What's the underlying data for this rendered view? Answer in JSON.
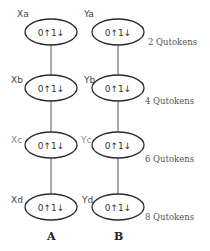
{
  "diagram": {
    "columns": [
      {
        "label": "A",
        "nodes": [
          {
            "name": "Xa",
            "text": "0↑1↓"
          },
          {
            "name": "Xb",
            "text": "0↑1↓"
          },
          {
            "name": "Xc",
            "text": "0↑1↓"
          },
          {
            "name": "Xd",
            "text": "0↑1↓"
          }
        ]
      },
      {
        "label": "B",
        "nodes": [
          {
            "name": "Ya",
            "text": "0↑1↓"
          },
          {
            "name": "Yb",
            "text": "0↑1↓"
          },
          {
            "name": "Yc",
            "text": "0↑1↓"
          },
          {
            "name": "Yd",
            "text": "0↑1↓"
          }
        ]
      }
    ],
    "row_labels": [
      "2 Qutokens",
      "4 Qutokens",
      "6 Qutokens",
      "8 Qutokens"
    ],
    "colors": {
      "stroke": "#2b2b2b",
      "line": "#555555",
      "faint_label": "#8a8a8a"
    }
  }
}
